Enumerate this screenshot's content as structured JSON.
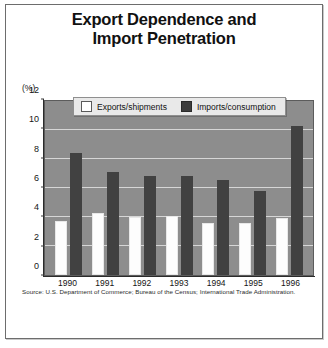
{
  "figure": {
    "title_lines": [
      "Export Dependence and",
      "Import Penetration"
    ],
    "unit_label": "(%)",
    "source": "Source: U.S. Department of Commerce; Bureau of the Census; International Trade Administration.",
    "colors": {
      "plot_background": "#8d8d8d",
      "gridline": "#d6d6d6",
      "exports_bar": "#fdfdfd",
      "imports_bar": "#414141",
      "legend_background": "#e9e9e9",
      "frame_border": "#6d6d6d",
      "page_background": "#ffffff",
      "text": "#111111"
    }
  },
  "legend": {
    "position": "top-inside",
    "entries": [
      {
        "label": "Exports/shipments",
        "swatch": "exports"
      },
      {
        "label": "Imports/consumption",
        "swatch": "imports"
      }
    ]
  },
  "chart_data": {
    "type": "bar",
    "title": "Export Dependence and Import Penetration",
    "xlabel": "",
    "ylabel": "(%)",
    "ylim": [
      0,
      12
    ],
    "yticks": [
      0,
      2,
      4,
      6,
      8,
      10,
      12
    ],
    "ytick_labels": [
      "0",
      "2",
      "4",
      "6",
      "8",
      "10",
      "12"
    ],
    "grid": true,
    "legend_position": "top-inside",
    "categories": [
      "1990",
      "1991",
      "1992",
      "1993",
      "1994",
      "1995",
      "1996"
    ],
    "series": [
      {
        "name": "Exports/shipments",
        "color": "#fdfdfd",
        "values": [
          3.7,
          4.25,
          4.0,
          4.1,
          3.6,
          3.6,
          3.9
        ]
      },
      {
        "name": "Imports/consumption",
        "color": "#414141",
        "values": [
          8.4,
          7.1,
          6.85,
          6.85,
          6.55,
          5.8,
          10.3
        ]
      }
    ],
    "source": "Source: U.S. Department of Commerce; Bureau of the Census; International Trade Administration."
  }
}
